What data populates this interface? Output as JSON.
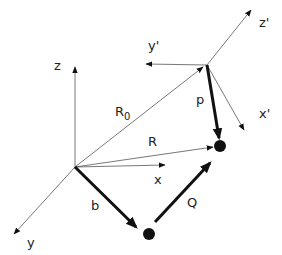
{
  "diagram": {
    "colors": {
      "thin_line": "#555555",
      "thick_line": "#111111",
      "text": "#222222",
      "background": "#ffffff"
    },
    "origins": {
      "lab": {
        "x": 75,
        "y": 167
      },
      "primed": {
        "x": 207,
        "y": 65
      }
    },
    "axes": {
      "lab": [
        {
          "id": "z",
          "label": "z",
          "x2": 75,
          "y2": 67,
          "label_x": 54,
          "label_y": 70
        },
        {
          "id": "x",
          "label": "x",
          "x2": 165,
          "y2": 165,
          "label_x": 154,
          "label_y": 184
        },
        {
          "id": "y",
          "label": "y",
          "x2": 14,
          "y2": 234,
          "label_x": 27,
          "label_y": 247
        }
      ],
      "primed": [
        {
          "id": "z_prime",
          "label": "z'",
          "x2": 251,
          "y2": 10,
          "label_x": 259,
          "label_y": 27
        },
        {
          "id": "y_prime",
          "label": "y'",
          "x2": 146,
          "y2": 64,
          "label_x": 148,
          "label_y": 50
        },
        {
          "id": "x_prime",
          "label": "x'",
          "x2": 244,
          "y2": 130,
          "label_x": 259,
          "label_y": 118
        }
      ]
    },
    "vectors": [
      {
        "id": "R0",
        "label": "R",
        "subscript": "0",
        "x1": 75,
        "y1": 167,
        "x2": 203,
        "y2": 67,
        "thick": false,
        "label_x": 115,
        "label_y": 116
      },
      {
        "id": "R",
        "label": "R",
        "subscript": "",
        "x1": 75,
        "y1": 167,
        "x2": 213,
        "y2": 147,
        "thick": false,
        "label_x": 148,
        "label_y": 146
      },
      {
        "id": "p",
        "label": "p",
        "subscript": "",
        "x1": 207,
        "y1": 65,
        "x2": 219,
        "y2": 138,
        "thick": true,
        "label_x": 196,
        "label_y": 104
      },
      {
        "id": "b",
        "label": "b",
        "subscript": "",
        "x1": 75,
        "y1": 167,
        "x2": 136,
        "y2": 227,
        "thick": true,
        "label_x": 91,
        "label_y": 210
      },
      {
        "id": "Q",
        "label": "Q",
        "subscript": "",
        "x1": 155,
        "y1": 222,
        "x2": 210,
        "y2": 163,
        "thick": true,
        "label_x": 187,
        "label_y": 207
      }
    ],
    "points": [
      {
        "id": "particle_upper",
        "x": 220,
        "y": 146,
        "r": 6
      },
      {
        "id": "particle_lower",
        "x": 149,
        "y": 234,
        "r": 6
      }
    ]
  }
}
